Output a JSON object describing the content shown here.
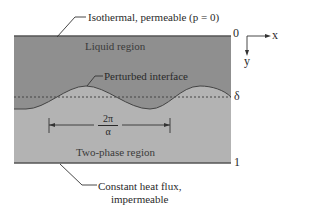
{
  "figure": {
    "type": "schematic",
    "colors": {
      "liquid_region": "#8f8f8f",
      "two_phase_region": "#b3b3b3",
      "lines": "#3a3a3a",
      "background": "#ffffff"
    },
    "labels": {
      "top_boundary": "Isothermal, permeable (p = 0)",
      "liquid_region": "Liquid region",
      "perturbed_interface": "Perturbed interface",
      "wavelength_numerator": "2π",
      "wavelength_denominator": "α",
      "two_phase_region": "Two-phase region",
      "bottom_boundary_line1": "Constant heat flux,",
      "bottom_boundary_line2": "impermeable"
    },
    "depth_markers": {
      "top": "0",
      "interface": "δ",
      "bottom": "1"
    },
    "axes": {
      "x_label": "x",
      "y_label": "y"
    }
  }
}
